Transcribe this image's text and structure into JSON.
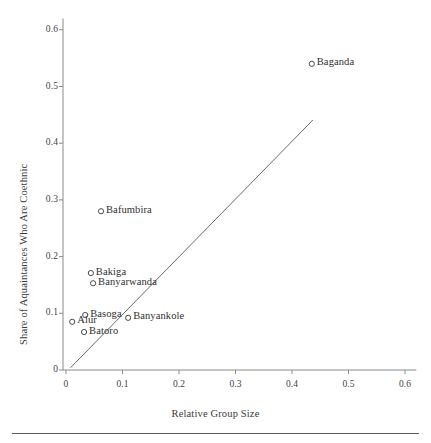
{
  "figure": {
    "background_color": "#ffffff",
    "axis_color": "#8a8a8a",
    "line_color": "#6b6b6b",
    "marker_color": "#4a4a4a",
    "text_color": "#3a3a3a",
    "rule_color": "#5a5a5a"
  },
  "chart_data": {
    "type": "scatter",
    "title": "",
    "xlabel": "Relative Group Size",
    "ylabel": "Share of Aquaintances Who Are Coethnic",
    "xlim": [
      0,
      0.62
    ],
    "ylim": [
      0,
      0.62
    ],
    "xticks": [
      0,
      0.1,
      0.2,
      0.3,
      0.4,
      0.5,
      0.6
    ],
    "xticklabels": [
      "0",
      "0.1",
      "0.2",
      "0.3",
      "0.4",
      "0.5",
      "0.6"
    ],
    "yticks": [
      0,
      0.1,
      0.2,
      0.3,
      0.4,
      0.5,
      0.6
    ],
    "yticklabels": [
      "0",
      "0.1",
      "0.2",
      "0.3",
      "0.4",
      "0.5",
      "0.6"
    ],
    "grid": false,
    "legend": false,
    "marker_style": "open-circle",
    "points": [
      {
        "label": "Baganda",
        "x": 0.435,
        "y": 0.54,
        "label_side": "right"
      },
      {
        "label": "Bafumbira",
        "x": 0.062,
        "y": 0.28,
        "label_side": "right"
      },
      {
        "label": "Bakiga",
        "x": 0.044,
        "y": 0.171,
        "label_side": "right"
      },
      {
        "label": "Banyarwanda",
        "x": 0.048,
        "y": 0.153,
        "label_side": "right"
      },
      {
        "label": "Banyankole",
        "x": 0.11,
        "y": 0.092,
        "label_side": "right"
      },
      {
        "label": "Basoga",
        "x": 0.034,
        "y": 0.097,
        "label_side": "right"
      },
      {
        "label": "Alur",
        "x": 0.011,
        "y": 0.085,
        "label_side": "right"
      },
      {
        "label": "Batoro",
        "x": 0.032,
        "y": 0.067,
        "label_side": "right"
      }
    ],
    "fit_line": {
      "type": "linear-fit",
      "x_start": 0.008,
      "y_start": 0.004,
      "x_end": 0.437,
      "y_end": 0.441
    }
  }
}
